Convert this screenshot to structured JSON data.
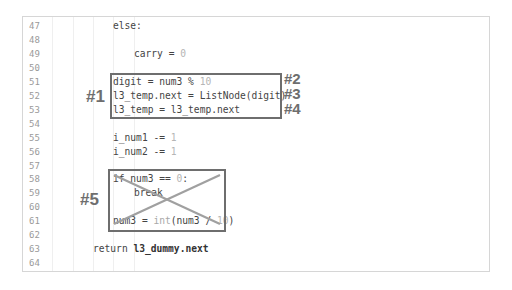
{
  "editor": {
    "lines": [
      {
        "n": "47",
        "text": "else:",
        "indent": 3
      },
      {
        "n": "48",
        "text": "",
        "indent": 0
      },
      {
        "n": "49",
        "text": "carry = ",
        "num": "0",
        "indent": 4
      },
      {
        "n": "50",
        "text": "",
        "indent": 0
      },
      {
        "n": "51",
        "text": "digit = num3 % ",
        "num": "10",
        "indent": 3
      },
      {
        "n": "52",
        "text": "l3_temp.next = ListNode(digit)",
        "indent": 3
      },
      {
        "n": "53",
        "text": "l3_temp = l3_temp.next",
        "indent": 3
      },
      {
        "n": "54",
        "text": "",
        "indent": 0
      },
      {
        "n": "55",
        "text": "i_num1 -= ",
        "num": "1",
        "indent": 3
      },
      {
        "n": "56",
        "text": "i_num2 -= ",
        "num": "1",
        "indent": 3
      },
      {
        "n": "57",
        "text": "",
        "indent": 0
      },
      {
        "n": "58",
        "text": "if num3 == ",
        "num": "0",
        "suffix": ":",
        "indent": 3
      },
      {
        "n": "59",
        "text": "break",
        "indent": 4
      },
      {
        "n": "60",
        "text": "",
        "indent": 0
      },
      {
        "n": "61",
        "text": "num3 = ",
        "builtin": "int",
        "rest": "(num3 / ",
        "num": "10",
        "suffix": ")",
        "indent": 3
      },
      {
        "n": "62",
        "text": "",
        "indent": 0
      },
      {
        "n": "63",
        "text": "return ",
        "bold": "l3_dummy.next",
        "indent": 2
      },
      {
        "n": "64",
        "text": "",
        "indent": 0
      }
    ]
  },
  "annotations": {
    "box1_label": "#1",
    "box1_side_labels": [
      "#2",
      "#3",
      "#4"
    ],
    "box5_label": "#5",
    "colors": {
      "annotation": "#6e6e6e",
      "cross": "#a0a0a0"
    }
  }
}
